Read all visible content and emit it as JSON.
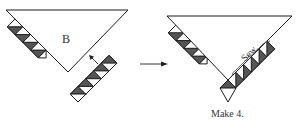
{
  "diagram": {
    "left_figure": {
      "triangle_label": "B",
      "left_strip_units": 4,
      "right_strip_units": 5
    },
    "right_figure": {
      "sew_label": "Sew.",
      "caption": "Make 4.",
      "left_strip_units": 4,
      "right_strip_units": 5
    },
    "colors": {
      "dark_fabric": "#555555",
      "light_fabric": "#ffffff",
      "line": "#1a1a1a"
    },
    "icons": [
      "arrow-right-icon",
      "arrow-up-left-icon"
    ]
  }
}
